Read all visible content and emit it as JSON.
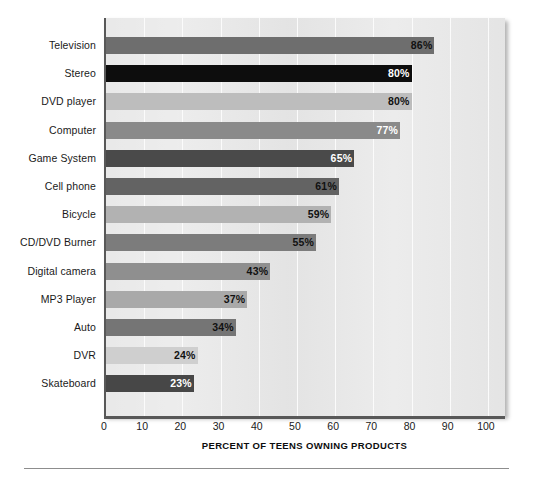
{
  "chart_data": {
    "type": "bar",
    "orientation": "horizontal",
    "title": "",
    "subtitle": "",
    "xlabel": "PERCENT OF TEENS OWNING PRODUCTS",
    "ylabel": "",
    "xlim": [
      0,
      105
    ],
    "ylim": null,
    "grid": true,
    "legend": null,
    "xticks": [
      0,
      10,
      20,
      30,
      40,
      50,
      60,
      70,
      80,
      90,
      100
    ],
    "xtick_labels": [
      "0",
      "10",
      "20",
      "30",
      "40",
      "50",
      "60",
      "70",
      "80",
      "90",
      "100"
    ],
    "categories": [
      "Television",
      "Stereo",
      "DVD player",
      "Computer",
      "Game System",
      "Cell phone",
      "Bicycle",
      "CD/DVD Burner",
      "Digital camera",
      "MP3 Player",
      "Auto",
      "DVR",
      "Skateboard"
    ],
    "values": [
      86,
      80,
      80,
      77,
      65,
      61,
      59,
      55,
      43,
      37,
      34,
      24,
      23
    ],
    "value_labels": [
      "86%",
      "80%",
      "80%",
      "77%",
      "65%",
      "61%",
      "59%",
      "55%",
      "43%",
      "37%",
      "34%",
      "24%",
      "23%"
    ],
    "bar_colors": [
      "#6e6e6e",
      "#0d0d0d",
      "#bdbdbd",
      "#8a8a8a",
      "#4a4a4a",
      "#636363",
      "#b2b2b2",
      "#7c7c7c",
      "#8f8f8f",
      "#a9a9a9",
      "#757575",
      "#cfcfcf",
      "#474747"
    ],
    "value_label_colors": [
      "#111111",
      "#ffffff",
      "#111111",
      "#ffffff",
      "#ffffff",
      "#111111",
      "#111111",
      "#111111",
      "#111111",
      "#111111",
      "#111111",
      "#111111",
      "#ffffff"
    ],
    "plot_background": "#e9e9e9",
    "axis_color": "#585858",
    "gridline_color": "#fbfbfb"
  }
}
